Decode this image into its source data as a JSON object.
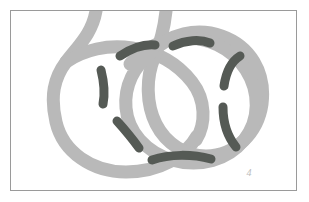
{
  "figure": {
    "kind": "knot-diagram",
    "caption_mark": "4",
    "frame": {
      "x": 10,
      "y": 10,
      "width": 287,
      "height": 181,
      "border_color": "#9a9a9a",
      "background": "#ffffff"
    },
    "colors": {
      "background": "#ffffff",
      "strand": "#b9b9b9",
      "strand_shadow": "#c8c8c8",
      "overstrand_mark": "#555a55",
      "border": "#9a9a9a",
      "label": "#b0b0b0"
    },
    "strand": {
      "name": "light-gray-knot-strand",
      "stroke_width": 13,
      "color": "#b9b9b9",
      "description": "Two interlocking loops drawn as a thick light gray band with two free ends exiting the top edge of the frame"
    },
    "marks": {
      "name": "dark-crossing-marks",
      "color": "#555a55",
      "stroke_width": 9,
      "count": 7,
      "description": "Short dark gray arcs laid over the light strand indicating crossings"
    },
    "paths": {
      "strand_left_tail": "M 96 11 C 92 34 78 46 66 62 C 54 78 50 96 56 122 C 63 152 92 172 126 172 C 160 172 186 156 197 136",
      "strand_right_tail": "M 166 11 C 164 30 160 44 154 58 C 146 78 146 104 156 124 C 166 144 186 156 206 156 C 236 156 258 132 262 104 C 266 72 250 46 222 36 C 196 27 170 34 152 52",
      "strand_outer_loop": "M 152 52 C 134 66 124 86 126 108 C 128 132 146 152 172 160 C 200 168 228 160 244 140 C 260 120 260 92 246 70 C 232 48 206 36 180 38 C 160 40 142 50 130 64",
      "strand_left_loop": "M 66 62 C 84 50 108 44 132 48 C 158 52 178 64 192 82 C 206 100 206 124 196 140",
      "marks": [
        "M 120 56 C 132 48 144 44 155 45",
        "M 173 46 C 186 40 200 39 210 43",
        "M 101 70 C 104 82 105 94 103 104",
        "M 117 121 C 126 131 134 141 139 148",
        "M 152 160 C 170 154 192 154 211 159",
        "M 224 86 C 226 72 232 61 240 56",
        "M 223 107 C 223 122 227 136 236 147"
      ]
    }
  }
}
